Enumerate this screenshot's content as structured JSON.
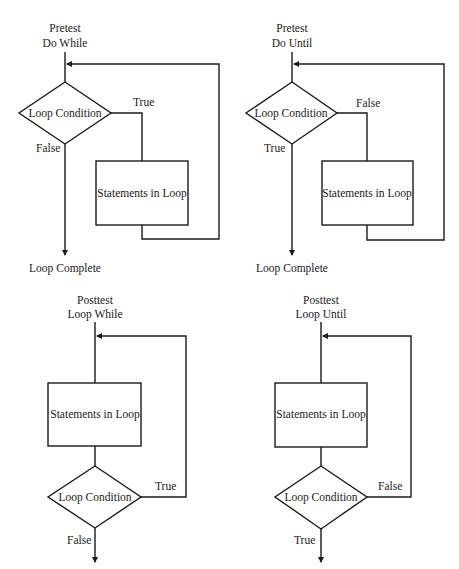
{
  "diagrams": [
    {
      "id": "pretest-do-while",
      "title_line1": "Pretest",
      "title_line2": "Do While",
      "condition": "Loop Condition",
      "body": "Statements in Loop",
      "loop_branch": "True",
      "exit_branch": "False",
      "exit_label": "Loop Complete"
    },
    {
      "id": "pretest-do-until",
      "title_line1": "Pretest",
      "title_line2": "Do Until",
      "condition": "Loop Condition",
      "body": "Statements in Loop",
      "loop_branch": "False",
      "exit_branch": "True",
      "exit_label": "Loop Complete"
    },
    {
      "id": "posttest-loop-while",
      "title_line1": "Posttest",
      "title_line2": "Loop While",
      "condition": "Loop Condition",
      "body": "Statements in Loop",
      "loop_branch": "True",
      "exit_branch": "False"
    },
    {
      "id": "posttest-loop-until",
      "title_line1": "Posttest",
      "title_line2": "Loop Until",
      "condition": "Loop Condition",
      "body": "Statements in Loop",
      "loop_branch": "False",
      "exit_branch": "True"
    }
  ]
}
